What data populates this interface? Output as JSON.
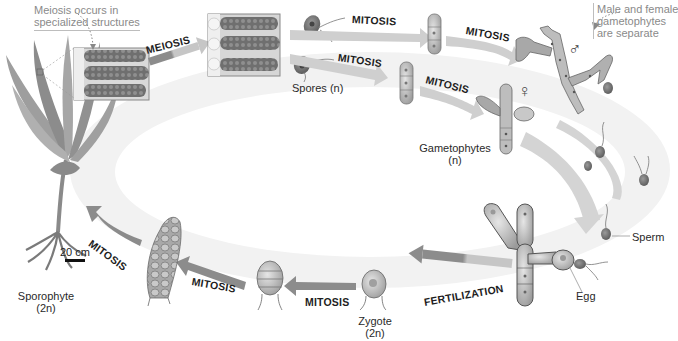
{
  "diagram": {
    "type": "life-cycle",
    "colors": {
      "background": "#ffffff",
      "cycle_band": "#ececec",
      "arrow_light": "#c8c8c8",
      "arrow_dark": "#8e8e8e",
      "organism_fill": "#b4b4b4",
      "organism_dark": "#6e6e6e",
      "text": "#222222",
      "note_text": "#8a8a8a"
    },
    "notes": {
      "meiosis_location": [
        "Meiosis occurs in",
        "specialized structures"
      ],
      "separate_gametophytes": [
        "Male and female",
        "gametophytes",
        "are separate"
      ]
    },
    "stages": {
      "sporophyte": {
        "name": "Sporophyte",
        "ploidy": "(2n)"
      },
      "spores": {
        "name": "Spores (n)"
      },
      "gametophytes": {
        "name": "Gametophytes",
        "ploidy": "(n)"
      },
      "sperm": {
        "name": "Sperm"
      },
      "egg": {
        "name": "Egg"
      },
      "zygote": {
        "name": "Zygote",
        "ploidy": "(2n)"
      }
    },
    "processes": {
      "meiosis": "MEIOSIS",
      "mitosis_upper": "MITOSIS",
      "mitosis_lower": "MITOSIS",
      "mitosis_male": "MITOSIS",
      "mitosis_female": "MITOSIS",
      "fertilization": "FERTILIZATION",
      "mitosis_zygote": "MITOSIS",
      "mitosis_embryo": "MITOSIS",
      "mitosis_sporophyte": "MITOSIS"
    },
    "symbols": {
      "male": "♂",
      "female": "♀"
    },
    "scale": {
      "label": "20 cm"
    }
  }
}
